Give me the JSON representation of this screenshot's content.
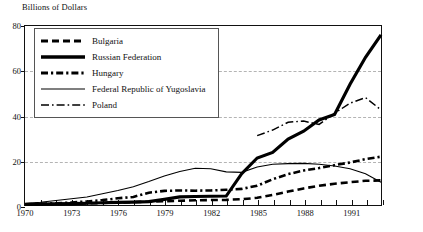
{
  "chart_data": {
    "type": "line",
    "title": "",
    "ylabel": "Billions of Dollars",
    "xlabel": "",
    "ylim": [
      0,
      80
    ],
    "yticks": [
      0,
      20,
      40,
      60,
      80
    ],
    "xlim": [
      1970,
      1993
    ],
    "xticks_labeled": [
      "1970",
      "1973",
      "1976",
      "1979",
      "1982",
      "1985",
      "1988",
      "1991"
    ],
    "xticks_all": [
      1970,
      1971,
      1972,
      1973,
      1974,
      1975,
      1976,
      1977,
      1978,
      1979,
      1980,
      1981,
      1982,
      1983,
      1984,
      1985,
      1986,
      1987,
      1988,
      1989,
      1990,
      1991,
      1992,
      1993
    ],
    "grid": "horizontal-dashed",
    "legend_position": "upper-left",
    "x": [
      1970,
      1971,
      1972,
      1973,
      1974,
      1975,
      1976,
      1977,
      1978,
      1979,
      1980,
      1981,
      1982,
      1983,
      1984,
      1985,
      1986,
      1987,
      1988,
      1989,
      1990,
      1991,
      1992,
      1993
    ],
    "series": [
      {
        "name": "Bulgaria",
        "style": "dashed",
        "width": 2.6,
        "color": "#000000",
        "values": [
          0.2,
          0.3,
          0.4,
          0.5,
          0.7,
          0.9,
          1.1,
          1.3,
          1.5,
          1.7,
          1.9,
          2.1,
          2.2,
          2.3,
          2.6,
          3.2,
          4.5,
          6.0,
          7.4,
          8.6,
          9.5,
          10.2,
          10.8,
          11.0
        ]
      },
      {
        "name": "Russian Federation",
        "style": "solid",
        "width": 3.2,
        "color": "#000000",
        "values": [
          0.3,
          0.4,
          0.5,
          0.6,
          0.8,
          1.0,
          1.2,
          1.3,
          1.5,
          2.5,
          3.6,
          3.8,
          3.9,
          4.0,
          14.0,
          21.0,
          23.5,
          29.5,
          33.0,
          38.0,
          40.5,
          54.0,
          66.0,
          76.0
        ]
      },
      {
        "name": "Hungary",
        "style": "dash-dot-thick",
        "width": 2.6,
        "color": "#000000",
        "values": [
          0.3,
          0.5,
          0.8,
          1.1,
          1.6,
          2.2,
          3.0,
          3.6,
          5.5,
          6.3,
          6.5,
          6.4,
          6.5,
          6.8,
          7.2,
          8.6,
          11.5,
          13.8,
          15.4,
          16.5,
          17.8,
          19.0,
          20.5,
          21.6
        ]
      },
      {
        "name": "Federal Republic of Yugoslavia",
        "style": "solid-thin",
        "width": 1.1,
        "color": "#000000",
        "values": [
          0.6,
          1.2,
          2.0,
          2.8,
          3.6,
          5.0,
          6.5,
          8.2,
          10.5,
          13.0,
          15.0,
          16.4,
          16.2,
          14.8,
          14.6,
          17.0,
          18.2,
          18.5,
          18.6,
          18.2,
          17.4,
          16.2,
          14.0,
          10.2
        ]
      },
      {
        "name": "Poland",
        "style": "dash-dot-thin",
        "width": 1.5,
        "color": "#000000",
        "values": [
          null,
          null,
          null,
          null,
          null,
          null,
          null,
          null,
          null,
          null,
          null,
          null,
          null,
          null,
          null,
          31.0,
          33.5,
          37.0,
          37.5,
          36.0,
          41.0,
          45.5,
          48.0,
          42.5
        ]
      }
    ]
  },
  "legend": {
    "items": [
      {
        "label": "Bulgaria",
        "swatch": "dashed-thick"
      },
      {
        "label": "Russian Federation",
        "swatch": "solid-thick"
      },
      {
        "label": "Hungary",
        "swatch": "dash-dot-thick"
      },
      {
        "label": "Federal Republic of Yugoslavia",
        "swatch": "solid-thin"
      },
      {
        "label": "Poland",
        "swatch": "dash-dot-thin"
      }
    ]
  },
  "bottom_note": ""
}
